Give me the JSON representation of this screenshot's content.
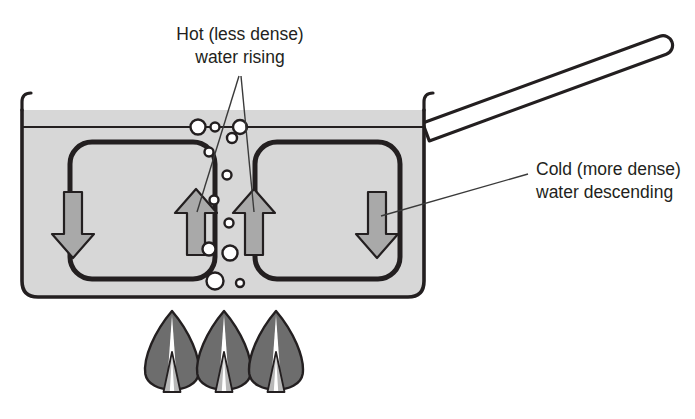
{
  "figure": {
    "type": "diagram"
  },
  "labels": {
    "hot": {
      "line1": "Hot (less dense)",
      "line2": "water rising",
      "x": 240,
      "y": 40
    },
    "cold": {
      "line1": "Cold (more dense)",
      "line2": "water descending",
      "x": 536,
      "y": 175
    }
  },
  "colors": {
    "outline": "#231f20",
    "water_fill": "#d7d7d7",
    "arrow_fill": "#a9a9a9",
    "flame_body": "#6d6d6d",
    "flame_inner": "#b8b8b8",
    "flame_core": "#ffffff",
    "bubble_fill": "#ffffff",
    "background": "#ffffff",
    "leader_line": "#3a3a3a"
  },
  "pot": {
    "name": "cooking-pot",
    "left": 22,
    "right": 424,
    "water_line_y": 127,
    "rim_top_y": 110,
    "bottom_y": 297,
    "corner_radius": 16,
    "wall_thickness": 3.5,
    "handle": {
      "angle_deg": -17,
      "length": 262,
      "thickness": 19,
      "tip_x": 672,
      "tip_y": 42
    }
  },
  "convection_loops": [
    {
      "name": "left-loop",
      "x": 70,
      "y": 142,
      "width": 145,
      "height": 137,
      "radius": 22,
      "descending_arrow": {
        "cx": 73,
        "cy": 225,
        "dir": "down"
      },
      "rising_arrow": {
        "cx": 196,
        "cy": 222,
        "dir": "up"
      }
    },
    {
      "name": "right-loop",
      "x": 255,
      "y": 142,
      "width": 145,
      "height": 137,
      "radius": 22,
      "rising_arrow": {
        "cx": 254,
        "cy": 222,
        "dir": "up"
      },
      "descending_arrow": {
        "cx": 377,
        "cy": 225,
        "dir": "down"
      }
    }
  ],
  "arrows": [
    {
      "name": "arrow-left-descending",
      "cx": 73,
      "cy": 225,
      "direction": "down",
      "meaning": "cold water descending"
    },
    {
      "name": "arrow-center-left-rising",
      "cx": 196,
      "cy": 222,
      "direction": "up",
      "meaning": "hot water rising"
    },
    {
      "name": "arrow-center-right-rising",
      "cx": 254,
      "cy": 222,
      "direction": "up",
      "meaning": "hot water rising"
    },
    {
      "name": "arrow-right-descending",
      "cx": 377,
      "cy": 225,
      "direction": "down",
      "meaning": "cold water descending"
    }
  ],
  "bubbles": [
    {
      "cx": 198,
      "cy": 127,
      "r": 7.5
    },
    {
      "cx": 215,
      "cy": 127,
      "r": 4.5
    },
    {
      "cx": 240,
      "cy": 127,
      "r": 7.0
    },
    {
      "cx": 232,
      "cy": 138,
      "r": 5.0
    },
    {
      "cx": 209,
      "cy": 152,
      "r": 4.5
    },
    {
      "cx": 227,
      "cy": 175,
      "r": 4.5
    },
    {
      "cx": 214,
      "cy": 200,
      "r": 4.5
    },
    {
      "cx": 229,
      "cy": 223,
      "r": 4.5
    },
    {
      "cx": 209,
      "cy": 249,
      "r": 6.5
    },
    {
      "cx": 230,
      "cy": 253,
      "r": 7.5
    },
    {
      "cx": 215,
      "cy": 281,
      "r": 8.5
    },
    {
      "cx": 240,
      "cy": 283,
      "r": 4.0
    }
  ],
  "leader_lines": [
    {
      "name": "leader-hot-left",
      "x1": 239,
      "y1": 76,
      "x2": 197,
      "y2": 212
    },
    {
      "name": "leader-hot-right",
      "x1": 241,
      "y1": 76,
      "x2": 254,
      "y2": 212
    },
    {
      "name": "leader-cold",
      "x1": 528,
      "y1": 174,
      "x2": 381,
      "y2": 216
    }
  ],
  "flames": [
    {
      "name": "flame-left",
      "cx": 172,
      "top_y": 311,
      "base_y": 396,
      "half_width": 29
    },
    {
      "name": "flame-center",
      "cx": 224,
      "top_y": 311,
      "base_y": 396,
      "half_width": 29
    },
    {
      "name": "flame-right",
      "cx": 276,
      "top_y": 311,
      "base_y": 396,
      "half_width": 29
    }
  ]
}
